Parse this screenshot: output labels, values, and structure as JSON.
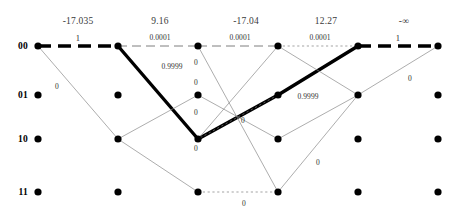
{
  "diagram": {
    "type": "viterbi-trellis",
    "width": 458,
    "height": 216,
    "colors": {
      "node": "#000000",
      "survivor_path": "#000000",
      "thin_edge": "#8a8a8a",
      "metric_text": "#3a3a3a",
      "label_text": "#2f2f2f"
    }
  },
  "column_metrics": [
    {
      "id": "metric-0",
      "value": "-17.035",
      "x": 78,
      "y": 16
    },
    {
      "id": "metric-1",
      "value": "9.16",
      "x": 160,
      "y": 16
    },
    {
      "id": "metric-2",
      "value": "-17.04",
      "x": 246,
      "y": 16
    },
    {
      "id": "metric-3",
      "value": "12.27",
      "x": 326,
      "y": 16
    },
    {
      "id": "metric-4",
      "value": "-∞",
      "x": 404,
      "y": 16
    }
  ],
  "states": [
    {
      "id": "state-00",
      "label": "00",
      "y": 46
    },
    {
      "id": "state-01",
      "label": "01",
      "y": 95
    },
    {
      "id": "state-10",
      "label": "10",
      "y": 139
    },
    {
      "id": "state-11",
      "label": "11",
      "y": 192
    }
  ],
  "columns_x": [
    38,
    118,
    198,
    278,
    358,
    438
  ],
  "nodes": [
    {
      "col": 0,
      "row": 0
    },
    {
      "col": 0,
      "row": 1
    },
    {
      "col": 0,
      "row": 2
    },
    {
      "col": 0,
      "row": 3
    },
    {
      "col": 1,
      "row": 0
    },
    {
      "col": 1,
      "row": 1
    },
    {
      "col": 1,
      "row": 2
    },
    {
      "col": 1,
      "row": 3
    },
    {
      "col": 2,
      "row": 0
    },
    {
      "col": 2,
      "row": 1
    },
    {
      "col": 2,
      "row": 2
    },
    {
      "col": 2,
      "row": 3
    },
    {
      "col": 3,
      "row": 0
    },
    {
      "col": 3,
      "row": 1
    },
    {
      "col": 3,
      "row": 2
    },
    {
      "col": 3,
      "row": 3
    },
    {
      "col": 4,
      "row": 0
    },
    {
      "col": 4,
      "row": 1
    },
    {
      "col": 4,
      "row": 2
    },
    {
      "col": 4,
      "row": 3
    },
    {
      "col": 5,
      "row": 0
    },
    {
      "col": 5,
      "row": 1
    },
    {
      "col": 5,
      "row": 2
    },
    {
      "col": 5,
      "row": 3
    }
  ],
  "edges": [
    {
      "id": "edge-bold-0-00-00",
      "from": [
        0,
        0
      ],
      "to": [
        1,
        0
      ],
      "style": "bold-dashed"
    },
    {
      "id": "edge-bold-1-00-10",
      "from": [
        1,
        0
      ],
      "to": [
        2,
        2
      ],
      "style": "bold-solid"
    },
    {
      "id": "edge-bold-2-10-01",
      "from": [
        2,
        2
      ],
      "to": [
        3,
        1
      ],
      "style": "bold-solid"
    },
    {
      "id": "edge-bold-3-01-00",
      "from": [
        3,
        1
      ],
      "to": [
        4,
        0
      ],
      "style": "bold-solid"
    },
    {
      "id": "edge-bold-4-00-00",
      "from": [
        4,
        0
      ],
      "to": [
        5,
        0
      ],
      "style": "bold-dashed"
    },
    {
      "id": "edge-dash-1-00-00",
      "from": [
        1,
        0
      ],
      "to": [
        2,
        0
      ],
      "style": "thin-dashed"
    },
    {
      "id": "edge-dash-2-00-00",
      "from": [
        2,
        0
      ],
      "to": [
        3,
        0
      ],
      "style": "thin-dashed"
    },
    {
      "id": "edge-dash-3-00-00",
      "from": [
        3,
        0
      ],
      "to": [
        4,
        0
      ],
      "style": "thin-dotted"
    },
    {
      "id": "edge-dash-11-2-3",
      "from": [
        2,
        3
      ],
      "to": [
        3,
        3
      ],
      "style": "thin-dotted"
    },
    {
      "id": "edge-dash-3-01-2-10",
      "from": [
        3,
        1
      ],
      "to": [
        2,
        2
      ],
      "style": "thin-dotted"
    },
    {
      "id": "edge-thin-0-00-10",
      "from": [
        0,
        0
      ],
      "to": [
        1,
        2
      ],
      "style": "thin-solid"
    },
    {
      "id": "edge-thin-1-10-01",
      "from": [
        1,
        2
      ],
      "to": [
        2,
        1
      ],
      "style": "thin-solid"
    },
    {
      "id": "edge-thin-1-10-11",
      "from": [
        1,
        2
      ],
      "to": [
        2,
        3
      ],
      "style": "thin-solid"
    },
    {
      "id": "edge-thin-2-00-11",
      "from": [
        2,
        0
      ],
      "to": [
        3,
        3
      ],
      "style": "thin-solid"
    },
    {
      "id": "edge-thin-2-01-10",
      "from": [
        2,
        1
      ],
      "to": [
        3,
        2
      ],
      "style": "thin-solid"
    },
    {
      "id": "edge-thin-2-10-3-00",
      "from": [
        2,
        2
      ],
      "to": [
        3,
        0
      ],
      "style": "thin-solid"
    },
    {
      "id": "edge-thin-3-10-4-01",
      "from": [
        3,
        2
      ],
      "to": [
        4,
        1
      ],
      "style": "thin-solid"
    },
    {
      "id": "edge-thin-3-11-4-01",
      "from": [
        3,
        3
      ],
      "to": [
        4,
        1
      ],
      "style": "thin-solid"
    },
    {
      "id": "edge-thin-4-01-5-00",
      "from": [
        4,
        1
      ],
      "to": [
        5,
        0
      ],
      "style": "thin-solid"
    },
    {
      "id": "edge-thin-3-00-4-01",
      "from": [
        3,
        0
      ],
      "to": [
        4,
        1
      ],
      "style": "thin-solid"
    }
  ],
  "edge_labels": [
    {
      "id": "label-first-one",
      "text": "1",
      "x": 78,
      "y": 38,
      "size": "big"
    },
    {
      "id": "label-last-one",
      "text": "1",
      "x": 398,
      "y": 38,
      "size": "big"
    },
    {
      "id": "label-p0001-a",
      "text": "0.0001",
      "x": 160,
      "y": 37,
      "size": "small"
    },
    {
      "id": "label-p0001-b",
      "text": "0.0001",
      "x": 240,
      "y": 37,
      "size": "small"
    },
    {
      "id": "label-p0001-c",
      "text": "0.0001",
      "x": 320,
      "y": 37,
      "size": "small"
    },
    {
      "id": "label-p9999-a",
      "text": "0.9999",
      "x": 172,
      "y": 66,
      "size": "small"
    },
    {
      "id": "label-p9999-b",
      "text": "0.9999",
      "x": 308,
      "y": 96,
      "size": "small"
    },
    {
      "id": "label-zero-a",
      "text": "0",
      "x": 57,
      "y": 86,
      "size": "small"
    },
    {
      "id": "label-zero-b",
      "text": "0",
      "x": 196,
      "y": 62,
      "size": "small"
    },
    {
      "id": "label-zero-c",
      "text": "0",
      "x": 196,
      "y": 82,
      "size": "small"
    },
    {
      "id": "label-zero-d",
      "text": "0",
      "x": 196,
      "y": 112,
      "size": "small"
    },
    {
      "id": "label-zero-e",
      "text": "0",
      "x": 196,
      "y": 148,
      "size": "small"
    },
    {
      "id": "label-zero-f",
      "text": "0",
      "x": 243,
      "y": 120,
      "size": "small"
    },
    {
      "id": "label-zero-g",
      "text": "0",
      "x": 244,
      "y": 203,
      "size": "small"
    },
    {
      "id": "label-zero-h",
      "text": "0",
      "x": 318,
      "y": 162,
      "size": "small"
    },
    {
      "id": "label-zero-i",
      "text": "0",
      "x": 410,
      "y": 78,
      "size": "small"
    }
  ]
}
